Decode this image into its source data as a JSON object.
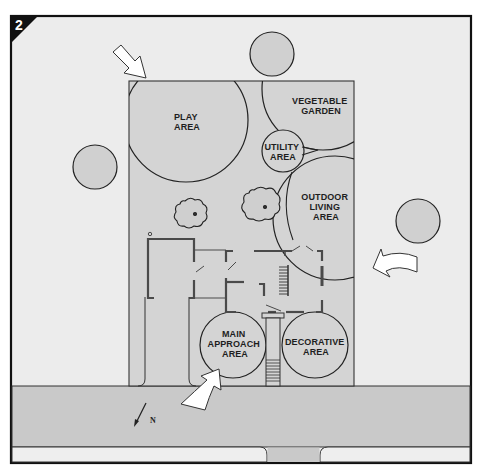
{
  "figure": {
    "badge_number": "2",
    "colors": {
      "background": "#ececec",
      "lot": "#d4d4d4",
      "street": "#c9c9c9",
      "sidewalk": "#eeeeee",
      "tree": "#d0d0d0",
      "outline": "#222222",
      "wall": "#4a4a4a",
      "arrow_fill": "#ffffff",
      "badge": "#111111"
    }
  },
  "zones": [
    {
      "id": "play",
      "lines": [
        "PLAY",
        "AREA"
      ]
    },
    {
      "id": "vegetable",
      "lines": [
        "VEGETABLE",
        "GARDEN"
      ]
    },
    {
      "id": "utility",
      "lines": [
        "UTILITY",
        "AREA"
      ]
    },
    {
      "id": "outdoor",
      "lines": [
        "OUTDOOR",
        "LIVING",
        "AREA"
      ]
    },
    {
      "id": "approach",
      "lines": [
        "MAIN",
        "APPROACH",
        "AREA"
      ]
    },
    {
      "id": "decorative",
      "lines": [
        "DECORATIVE",
        "AREA"
      ]
    }
  ],
  "compass": {
    "label": "N"
  },
  "arrows": [
    {
      "id": "northwest",
      "meaning": "entry-view arrow"
    },
    {
      "id": "east",
      "meaning": "entry-view arrow"
    },
    {
      "id": "street",
      "meaning": "entry-view arrow"
    }
  ]
}
